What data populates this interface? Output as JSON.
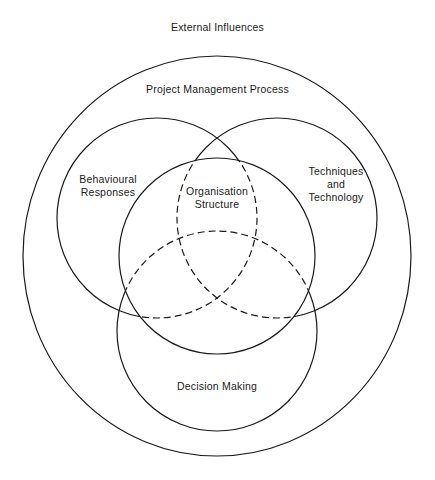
{
  "diagram": {
    "title": "External Influences",
    "outer_label": "Project Management Process",
    "circles": [
      {
        "id": "behavioural",
        "lines": [
          "Behavioural",
          "Responses"
        ]
      },
      {
        "id": "organisation",
        "lines": [
          "Organisation",
          "Structure"
        ]
      },
      {
        "id": "techniques",
        "lines": [
          "Techniques",
          "and",
          "Technology"
        ]
      },
      {
        "id": "decision",
        "lines": [
          "Decision Making"
        ]
      }
    ],
    "stroke_color": "#1a1a1a",
    "background": "#ffffff"
  }
}
